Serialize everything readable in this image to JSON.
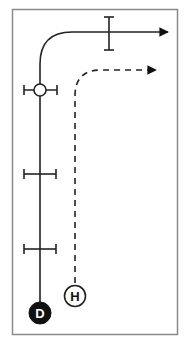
{
  "diagram": {
    "type": "path-diagram",
    "frame": {
      "x": 12,
      "y": 9,
      "width": 166,
      "height": 326,
      "stroke": "#8a8a8a"
    },
    "colors": {
      "line": "#222222",
      "node_fill_dark": "#111111",
      "node_text_light": "#ffffff",
      "node_fill_light": "#ffffff",
      "node_text_dark": "#111111"
    },
    "paths": [
      {
        "id": "solid-path",
        "style": "solid",
        "description": "Solid route from D up and curving right with arrow"
      },
      {
        "id": "dashed-path",
        "style": "dashed",
        "description": "Dashed route from H up and curving right with arrow"
      }
    ],
    "nodes": [
      {
        "id": "D",
        "label": "D",
        "style": "filled",
        "cx": 40,
        "cy": 313,
        "r": 11
      },
      {
        "id": "H",
        "label": "H",
        "style": "outline",
        "cx": 75,
        "cy": 296,
        "r": 10
      },
      {
        "id": "junction",
        "label": "",
        "style": "outline",
        "cx": 40,
        "cy": 90,
        "r": 6
      }
    ],
    "markers": [
      {
        "id": "bar-1",
        "orientation": "horizontal",
        "y": 90
      },
      {
        "id": "bar-2",
        "orientation": "horizontal",
        "y": 174
      },
      {
        "id": "bar-3",
        "orientation": "horizontal",
        "y": 249
      },
      {
        "id": "bar-top",
        "orientation": "vertical",
        "x": 109
      }
    ]
  }
}
